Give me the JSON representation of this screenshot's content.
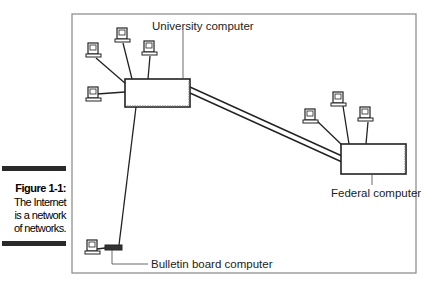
{
  "figure": {
    "number_label": "Figure 1-1:",
    "caption_lines": [
      "The Internet",
      "is a network",
      "of networks."
    ]
  },
  "diagram": {
    "nodes": [
      {
        "id": "university",
        "label": "University computer",
        "type": "host-box"
      },
      {
        "id": "federal",
        "label": "Federal computer",
        "type": "host-box"
      },
      {
        "id": "bulletin",
        "label": "Bulletin board computer",
        "type": "modem"
      }
    ],
    "links": [
      {
        "from": "university",
        "to": "federal",
        "style": "double-line"
      },
      {
        "from": "university",
        "to": "bulletin",
        "style": "single-line"
      }
    ],
    "terminals": {
      "university": 4,
      "federal": 3,
      "bulletin": 1
    }
  }
}
